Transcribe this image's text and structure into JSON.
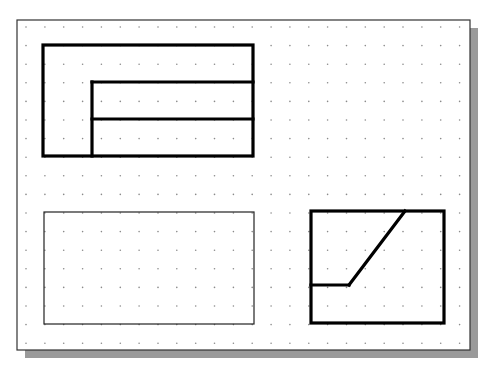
{
  "canvas": {
    "width": 490,
    "height": 370,
    "background": "#ffffff"
  },
  "sheet": {
    "x": 17,
    "y": 20,
    "width": 453,
    "height": 330,
    "border_color": "#333333",
    "border_width": 1.2,
    "shadow": {
      "offset_x": 8,
      "offset_y": 8,
      "color": "#9a9a9a"
    }
  },
  "grid": {
    "style": "dots",
    "origin_x": 26,
    "origin_y": 27,
    "spacing_x": 18.85,
    "spacing_y": 18.6,
    "cols": 24,
    "rows": 18,
    "dot_color": "#8a8a8a",
    "dot_radius": 0.8
  },
  "shapes": [
    {
      "name": "top-left-outer-rectangle",
      "type": "rect",
      "x": 43,
      "y": 45,
      "width": 210,
      "height": 111,
      "stroke": "#000000",
      "stroke_width": 3.2
    },
    {
      "name": "top-left-inner-vertical",
      "type": "line",
      "x1": 92,
      "y1": 82,
      "x2": 92,
      "y2": 156,
      "stroke": "#000000",
      "stroke_width": 3.2
    },
    {
      "name": "top-left-inner-horizontal-upper",
      "type": "line",
      "x1": 92,
      "y1": 82,
      "x2": 253,
      "y2": 82,
      "stroke": "#000000",
      "stroke_width": 3.2
    },
    {
      "name": "top-left-inner-horizontal-lower",
      "type": "line",
      "x1": 92,
      "y1": 119,
      "x2": 253,
      "y2": 119,
      "stroke": "#000000",
      "stroke_width": 3.2
    },
    {
      "name": "bottom-left-thin-rectangle",
      "type": "rect",
      "x": 44,
      "y": 212,
      "width": 210,
      "height": 112,
      "stroke": "#222222",
      "stroke_width": 1.2
    },
    {
      "name": "bottom-right-rectangle",
      "type": "rect",
      "x": 311,
      "y": 211,
      "width": 133,
      "height": 112,
      "stroke": "#000000",
      "stroke_width": 3.2
    },
    {
      "name": "bottom-right-step-horizontal",
      "type": "line",
      "x1": 311,
      "y1": 285,
      "x2": 349,
      "y2": 285,
      "stroke": "#000000",
      "stroke_width": 3.2
    },
    {
      "name": "bottom-right-diagonal",
      "type": "line",
      "x1": 349,
      "y1": 285,
      "x2": 405,
      "y2": 211,
      "stroke": "#000000",
      "stroke_width": 3.2
    }
  ]
}
